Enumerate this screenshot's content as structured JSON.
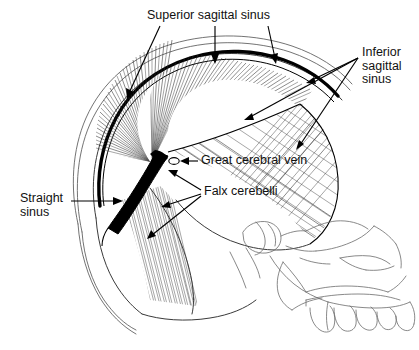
{
  "figure": {
    "background_color": "#ffffff",
    "ink_color": "#000000",
    "outline_color": "#5a5a5a",
    "width": 419,
    "height": 350
  },
  "labels": [
    {
      "id": "superior-sagittal-sinus",
      "text": "Superior sagittal sinus",
      "lines": [
        "Superior sagittal sinus"
      ],
      "x": 147,
      "y": 16,
      "anchor": "start",
      "arrow_count": 3
    },
    {
      "id": "inferior-sagittal-sinus",
      "text": "Inferior sagittal sinus",
      "lines": [
        "Inferior",
        "sagittal",
        "sinus"
      ],
      "x": 362,
      "y": 53,
      "anchor": "start",
      "arrow_count": 3
    },
    {
      "id": "great-cerebral-vein",
      "text": "Great cerebral vein",
      "lines": [
        "Great cerebral vein"
      ],
      "x": 201,
      "y": 159,
      "anchor": "start",
      "arrow_count": 1
    },
    {
      "id": "falx-cerebelli",
      "text": "Falx cerebelli",
      "lines": [
        "Falx cerebelli"
      ],
      "x": 204,
      "y": 192,
      "anchor": "start",
      "arrow_count": 2
    },
    {
      "id": "straight-sinus",
      "text": "Straight sinus",
      "lines": [
        "Straight",
        "sinus"
      ],
      "x": 20,
      "y": 199,
      "anchor": "start",
      "arrow_count": 1
    }
  ],
  "structures": [
    {
      "id": "skull-outer-table",
      "name": "outer table of cranial vault",
      "style": "thin gray contour"
    },
    {
      "id": "skull-inner-table",
      "name": "inner table of cranial vault",
      "style": "thin gray contour"
    },
    {
      "id": "superior-sagittal-sinus-band",
      "name": "superior sagittal sinus",
      "style": "thick black band along vault"
    },
    {
      "id": "falx-cerebri",
      "name": "falx cerebri",
      "style": "radiating hatched fan"
    },
    {
      "id": "straight-sinus-band",
      "name": "straight sinus",
      "style": "thick black diagonal band"
    },
    {
      "id": "great-cerebral-vein-lumen",
      "name": "great cerebral vein",
      "style": "small white ellipse on sinus"
    },
    {
      "id": "tentorium-cerebelli",
      "name": "tentorium cerebelli",
      "style": "cross-hatched sheet"
    },
    {
      "id": "falx-cerebelli-sheet",
      "name": "falx cerebelli",
      "style": "fine vertical hatching"
    },
    {
      "id": "facial-skeleton",
      "name": "facial bones, orbit, maxilla, mandible and teeth",
      "style": "thin gray line art"
    }
  ]
}
